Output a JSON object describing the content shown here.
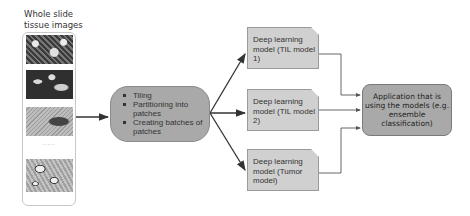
{
  "input": {
    "label": "Whole slide tissue images",
    "ellipsis": "....."
  },
  "process": {
    "items": [
      "Tiling",
      "Partitioning into patches",
      "Creating batches of patches"
    ]
  },
  "models": [
    {
      "label": "Deep learning model (TIL model 1)"
    },
    {
      "label": "Deep learning model (TIL model 2)"
    },
    {
      "label": "Deep learning model (Tumor model)"
    }
  ],
  "application": {
    "label": "Application that is using the models (e.g. ensemble classification)"
  },
  "colors": {
    "process_fill": "#a9a9a9",
    "model_fill": "#d0d0d0",
    "app_fill": "#a9a9a9",
    "arrow": "#333333"
  }
}
